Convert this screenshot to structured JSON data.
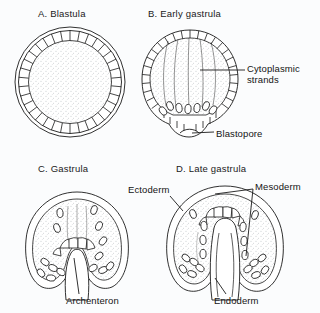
{
  "figure": {
    "width": 320,
    "height": 313,
    "background_color": "#fbfcfd",
    "ink_color": "#1a1a1a",
    "stipple_color": "#9aa0a6"
  },
  "panels": [
    {
      "id": "A",
      "title": "A. Blastula",
      "shape": "sphere"
    },
    {
      "id": "B",
      "title": "B. Early gastrula",
      "shape": "sphere-invaginating"
    },
    {
      "id": "C",
      "title": "C. Gastrula",
      "shape": "dome-archenteron"
    },
    {
      "id": "D",
      "title": "D. Late gastrula",
      "shape": "dome-three-layers"
    }
  ],
  "annotations": [
    {
      "id": "cytoplasmic-strands",
      "label": "Cytoplasmic\nstrands",
      "line1": "Cytoplasmic",
      "line2": "strands",
      "panel": "B"
    },
    {
      "id": "blastopore",
      "label": "Blastopore",
      "panel": "B"
    },
    {
      "id": "ectoderm",
      "label": "Ectoderm",
      "panel": "D"
    },
    {
      "id": "mesoderm",
      "label": "Mesoderm",
      "panel": "D"
    },
    {
      "id": "endoderm",
      "label": "Endoderm",
      "panel": "D"
    },
    {
      "id": "archenteron",
      "label": "Archenteron",
      "panel": "C"
    }
  ],
  "labels": {
    "title_a": "A. Blastula",
    "title_b": "B. Early gastrula",
    "title_c": "C. Gastrula",
    "title_d": "D. Late gastrula",
    "cytoplasmic_line1": "Cytoplasmic",
    "cytoplasmic_line2": "strands",
    "blastopore": "Blastopore",
    "ectoderm": "Ectoderm",
    "mesoderm": "Mesoderm",
    "endoderm": "Endoderm",
    "archenteron": "Archenteron"
  }
}
